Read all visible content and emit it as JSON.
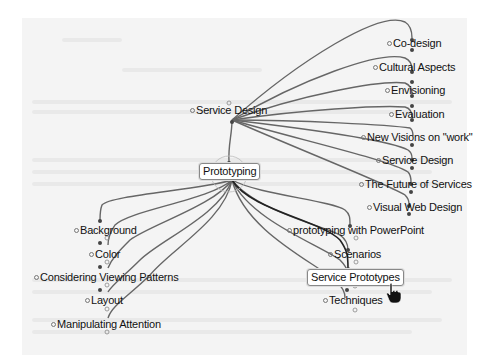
{
  "mindmap": {
    "root": {
      "label": "Service Design"
    },
    "focus": {
      "label": "Prototyping"
    },
    "upper_children": [
      {
        "label": "Co-design"
      },
      {
        "label": "Cultural Aspects"
      },
      {
        "label": "Envisioning"
      },
      {
        "label": "Evaluation"
      },
      {
        "label": "New Visions on \"work\""
      },
      {
        "label": "Service Design"
      },
      {
        "label": "The Future of Services"
      },
      {
        "label": "Visual Web Design"
      }
    ],
    "left_children": [
      {
        "label": "Background"
      },
      {
        "label": "Color"
      },
      {
        "label": "Considering Viewing Patterns"
      },
      {
        "label": "Layout"
      },
      {
        "label": "Manipulating Attention"
      }
    ],
    "right_children": [
      {
        "label": "prototyping with PowerPoint"
      },
      {
        "label": "Scenarios"
      },
      {
        "label": "Service Prototypes"
      },
      {
        "label": "Techniques"
      }
    ],
    "selected": "Service Prototypes"
  },
  "colors": {
    "edge": "#666666",
    "edge_highlight": "#222222",
    "background_doc": "#f4f4f4"
  },
  "cursor": {
    "icon": "hand-pointer-icon"
  }
}
